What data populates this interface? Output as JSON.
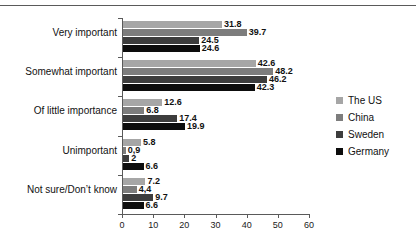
{
  "chart_data": {
    "type": "bar",
    "orientation": "horizontal",
    "title": "",
    "xlabel": "",
    "ylabel": "",
    "xlim": [
      0,
      60
    ],
    "xticks": [
      0,
      10,
      20,
      30,
      40,
      50,
      60
    ],
    "grid": false,
    "legend_position": "right",
    "categories": [
      "Very important",
      "Somewhat important",
      "Of little importance",
      "Unimportant",
      "Not sure/Don’t know"
    ],
    "series": [
      {
        "name": "The US",
        "color": "#a6a6a6",
        "values": [
          31.8,
          42.6,
          12.6,
          5.8,
          7.2
        ],
        "labels": [
          "31.8",
          "42.6",
          "12.6",
          "5.8",
          "7.2"
        ]
      },
      {
        "name": "China",
        "color": "#7d7d7d",
        "values": [
          39.7,
          48.2,
          6.8,
          0.9,
          4.4
        ],
        "labels": [
          "39.7",
          "48.2",
          "6.8",
          "0,9",
          "4,4"
        ]
      },
      {
        "name": "Sweden",
        "color": "#3d3d3d",
        "values": [
          24.5,
          46.2,
          17.4,
          2.0,
          9.7
        ],
        "labels": [
          "24.5",
          "46.2",
          "17.4",
          "2",
          "9.7"
        ]
      },
      {
        "name": "Germany",
        "color": "#0d0d0d",
        "values": [
          24.6,
          42.3,
          19.9,
          6.6,
          6.6
        ],
        "labels": [
          "24.6",
          "42.3",
          "19.9",
          "6.6",
          "6.6"
        ]
      }
    ]
  }
}
